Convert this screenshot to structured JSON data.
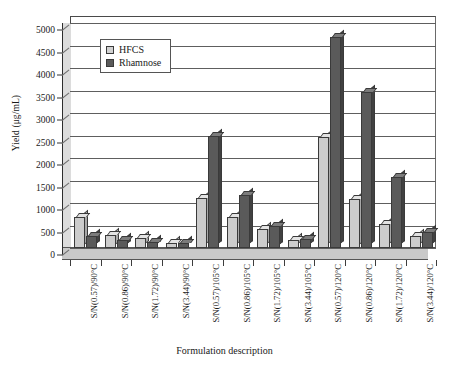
{
  "chart_data": {
    "type": "bar",
    "title": "",
    "xlabel": "Formulation description",
    "ylabel": "Yield (μg/mL)",
    "ylim": [
      0,
      5000
    ],
    "yticks": [
      0,
      500,
      1000,
      1500,
      2000,
      2500,
      3000,
      3500,
      4000,
      4500,
      5000
    ],
    "grid": true,
    "legend_position": "upper-left-inside",
    "style": "3d-grouped-bars-grayscale",
    "categories": [
      "S/N(0.57)/90°C",
      "S/N(0.86)/90°C",
      "S/N(1.72)/90°C",
      "S/N(3.44)/90°C",
      "S/N(0.57)/105°C",
      "S/N(0.86)/105°C",
      "S/N(1.72)/105°C",
      "S/N(3.44)/105°C",
      "S/N(0.57)/120°C",
      "S/N(0.86)/120°C",
      "S/N(1.72)/120°C",
      "S/N(3.44)/120°C"
    ],
    "series": [
      {
        "name": "HFCS",
        "color": "#cccccc",
        "values": [
          700,
          300,
          230,
          110,
          1120,
          690,
          420,
          180,
          2470,
          1100,
          530,
          260
        ]
      },
      {
        "name": "Rhamnose",
        "color": "#5a5a5a",
        "values": [
          270,
          180,
          130,
          110,
          2480,
          1180,
          500,
          200,
          4680,
          3470,
          1580,
          350
        ]
      }
    ]
  },
  "legend": {
    "items": [
      {
        "label": "HFCS"
      },
      {
        "label": "Rhamnose"
      }
    ]
  },
  "axes": {
    "y_title": "Yield (μg/mL)",
    "x_title": "Formulation description",
    "y_tick_labels": [
      "5000",
      "4500",
      "4000",
      "3500",
      "3000",
      "2500",
      "2000",
      "1500",
      "1000",
      "500",
      "0"
    ]
  }
}
